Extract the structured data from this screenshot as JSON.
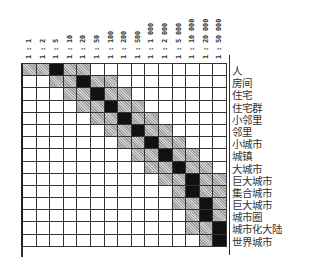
{
  "diagram": {
    "title": "",
    "columns": [
      "1 : 1",
      "1 : 2",
      "1 : 5",
      "1 : 10",
      "1 : 20",
      "1 : 50",
      "1 : 100",
      "1 : 200",
      "1 : 500",
      "1 : 1 000",
      "1 : 2 000",
      "1 : 5 000",
      "1 : 10 000",
      "1 : 20 000",
      "1 : 50 000",
      "1 : 100 000",
      "1 : 200 000",
      "1 : 500 000",
      "1 : 1 000 000",
      "1 : 2 000 000",
      "1 : 5 000 000",
      "1 : 10 000 000",
      "1 : 20 000 000",
      "1 : 50 000 000"
    ],
    "visible_columns": [
      "1 : 1",
      "1 : 2",
      "1 : 5",
      "1 : 10",
      "1 : 20",
      "1 : 50",
      "1 : 100",
      "1 : 200",
      "1 : 500",
      "1 : 1 000",
      "1 : 2 000",
      "1 : 5 000",
      "1 : 10 000",
      "1 : 20 000",
      "1 : 50 000"
    ],
    "rows": [
      "人",
      "房间",
      "住宅",
      "住宅群",
      "小邻里",
      "邻里",
      "小城市",
      "城镇",
      "大城市",
      "巨大城市",
      "集合城市",
      "巨大城市",
      "城市圈",
      "城市化大陆",
      "世界城市"
    ],
    "cell_legend": {
      "dark": "primary scale",
      "gray": "secondary scale",
      "white": "not applicable"
    },
    "colors": {
      "dark": "#111111",
      "gray": "#b8b8b8",
      "grid": "#333333",
      "background": "#ffffff"
    }
  },
  "matrix": {
    "n_cols": 15,
    "pattern": [
      {
        "dark": [
          2
        ],
        "gray": [
          0,
          1,
          3,
          4
        ]
      },
      {
        "dark": [
          4
        ],
        "gray": [
          2,
          3,
          5,
          6
        ]
      },
      {
        "dark": [
          5
        ],
        "gray": [
          3,
          4,
          6,
          7
        ]
      },
      {
        "dark": [
          6
        ],
        "gray": [
          4,
          5,
          7,
          8
        ]
      },
      {
        "dark": [
          7
        ],
        "gray": [
          5,
          6,
          8,
          9
        ]
      },
      {
        "dark": [
          8
        ],
        "gray": [
          6,
          7,
          9,
          10
        ]
      },
      {
        "dark": [
          9
        ],
        "gray": [
          7,
          8,
          10,
          11
        ]
      },
      {
        "dark": [
          10
        ],
        "gray": [
          8,
          9,
          11,
          12
        ]
      },
      {
        "dark": [
          11
        ],
        "gray": [
          9,
          10,
          12,
          13
        ]
      },
      {
        "dark": [
          12
        ],
        "gray": [
          10,
          11,
          13,
          14
        ]
      },
      {
        "dark": [
          12
        ],
        "gray": [
          11,
          13,
          14
        ]
      },
      {
        "dark": [
          13
        ],
        "gray": [
          11,
          12,
          14
        ]
      },
      {
        "dark": [
          13
        ],
        "gray": [
          12,
          14
        ]
      },
      {
        "dark": [
          14
        ],
        "gray": [
          12,
          13
        ]
      },
      {
        "dark": [
          14
        ],
        "gray": [
          13
        ]
      }
    ]
  }
}
